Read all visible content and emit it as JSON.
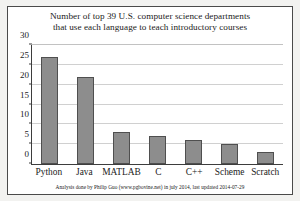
{
  "figure": {
    "background_color": "#f2f2f0",
    "panel_color": "#ffffff",
    "border_color": "#4a4a4a"
  },
  "title": {
    "line1": "Number of top 39 U.S. computer science departments",
    "line2": "that use each language to teach introductory courses"
  },
  "footer": {
    "text": "Analysis done by Philip Guo (www.pgbovine.net) in july 2014,    last updated 2014-07-29"
  },
  "axis": {
    "yticks": [
      "0",
      "5",
      "10",
      "15",
      "20",
      "25",
      "30"
    ]
  },
  "chart_data": {
    "type": "bar",
    "title": "Number of top 39 U.S. computer science departments that use each language to teach introductory courses",
    "categories": [
      "Python",
      "Java",
      "MATLAB",
      "C",
      "C++",
      "Scheme",
      "Scratch"
    ],
    "values": [
      27,
      22,
      8,
      7,
      6,
      5,
      3
    ],
    "xlabel": "",
    "ylabel": "",
    "ylim": [
      0,
      30
    ],
    "ytick_step": 5,
    "grid": true,
    "legend": false,
    "bar_color": "#8d8d8d",
    "bar_edge_color": "#4f4f4f",
    "annotation": "Analysis done by Philip Guo (www.pgbovine.net) in july 2014,    last updated 2014-07-29"
  }
}
